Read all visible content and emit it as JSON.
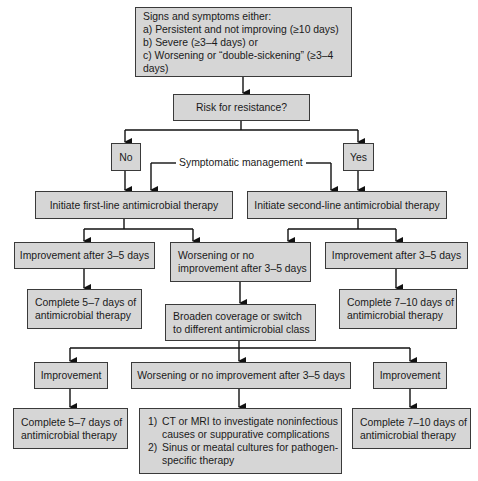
{
  "diagram": {
    "start": {
      "title": "Signs and symptoms either:",
      "lines": [
        "a) Persistent and not improving (≥10 days)",
        "b) Severe (≥3–4 days) or",
        "c) Worsening or “double-sickening” (≥3–4 days)"
      ]
    },
    "decision": "Risk for resistance?",
    "no_label": "No",
    "yes_label": "Yes",
    "symptomatic": "Symptomatic management",
    "first_line": "Initiate first-line antimicrobial therapy",
    "second_line": "Initiate second-line antimicrobial therapy",
    "left_improve": "Improvement after 3–5 days",
    "mid_worsen": [
      "Worsening or no",
      "improvement after 3–5 days"
    ],
    "right_improve": "Improvement after 3–5 days",
    "left_complete": [
      "Complete 5–7 days of",
      "antimicrobial therapy"
    ],
    "broaden": [
      "Broaden coverage or switch",
      "to different antimicrobial class"
    ],
    "right_complete": [
      "Complete 7–10 days of",
      "antimicrobial therapy"
    ],
    "bottom_left_improve": "Improvement",
    "bottom_mid_worsen": "Worsening or no improvement after 3–5 days",
    "bottom_right_improve": "Improvement",
    "bottom_left_complete": [
      "Complete 5–7 days of",
      "antimicrobial therapy"
    ],
    "final_steps": [
      {
        "num": "1)",
        "lines": [
          "CT or MRI to investigate noninfectious",
          "causes or suppurative complications"
        ]
      },
      {
        "num": "2)",
        "lines": [
          "Sinus or meatal cultures for pathogen-",
          "specific therapy"
        ]
      }
    ],
    "bottom_right_complete": [
      "Complete 7–10 days of",
      "antimicrobial therapy"
    ]
  },
  "colors": {
    "box_fill": "#d6d6d6",
    "border": "#3a3a3a",
    "line": "#111111"
  }
}
